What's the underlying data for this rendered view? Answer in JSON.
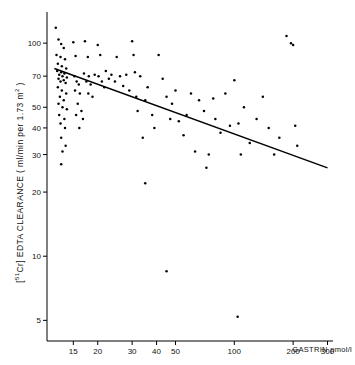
{
  "chart_data": {
    "type": "scatter",
    "title": "",
    "xlabel": "GASTRIN pmol/l",
    "ylabel": "[51Cr] EDTA CLEARANCE ( ml/min per 1.73 m2 )",
    "xscale": "log",
    "yscale": "log",
    "xlim": [
      11,
      320
    ],
    "ylim": [
      4,
      140
    ],
    "xticks": [
      15,
      20,
      30,
      40,
      50,
      100,
      200,
      300
    ],
    "xticklabels": [
      "15",
      "20",
      "30",
      "40",
      "50",
      "100",
      "200",
      "300"
    ],
    "yticks": [
      5,
      10,
      20,
      30,
      40,
      50,
      70,
      100
    ],
    "yticklabels": [
      "5",
      "10",
      "20",
      "30",
      "40",
      "50",
      "70",
      "100"
    ],
    "grid": false,
    "legend": null,
    "series": [
      {
        "name": "patients",
        "marker": "dot",
        "color": "#000000",
        "points": [
          [
            12.2,
            118
          ],
          [
            12.6,
            104
          ],
          [
            13.0,
            99
          ],
          [
            13.4,
            95
          ],
          [
            12.3,
            88
          ],
          [
            12.9,
            86
          ],
          [
            13.6,
            84
          ],
          [
            12.5,
            80
          ],
          [
            13.1,
            78
          ],
          [
            13.8,
            76
          ],
          [
            12.4,
            74
          ],
          [
            13.0,
            73
          ],
          [
            13.5,
            72
          ],
          [
            12.7,
            71
          ],
          [
            13.2,
            70
          ],
          [
            13.9,
            69
          ],
          [
            12.6,
            68
          ],
          [
            13.4,
            67
          ],
          [
            12.9,
            66
          ],
          [
            13.7,
            65
          ],
          [
            12.5,
            62
          ],
          [
            13.1,
            60
          ],
          [
            13.8,
            58
          ],
          [
            12.8,
            56
          ],
          [
            13.4,
            54
          ],
          [
            12.6,
            52
          ],
          [
            13.2,
            50
          ],
          [
            13.9,
            49
          ],
          [
            12.7,
            46
          ],
          [
            13.5,
            44
          ],
          [
            12.9,
            42
          ],
          [
            13.6,
            40
          ],
          [
            13.0,
            36
          ],
          [
            13.7,
            33
          ],
          [
            13.2,
            31
          ],
          [
            15.0,
            101
          ],
          [
            15.4,
            87
          ],
          [
            15.2,
            70
          ],
          [
            15.6,
            66
          ],
          [
            16.0,
            64
          ],
          [
            15.3,
            60
          ],
          [
            16.2,
            58
          ],
          [
            15.8,
            52
          ],
          [
            16.5,
            48
          ],
          [
            15.5,
            46
          ],
          [
            16.8,
            44
          ],
          [
            16.1,
            40
          ],
          [
            17.2,
            102
          ],
          [
            17.8,
            86
          ],
          [
            17.0,
            72
          ],
          [
            18.0,
            70
          ],
          [
            17.5,
            66
          ],
          [
            18.4,
            64
          ],
          [
            17.9,
            58
          ],
          [
            18.8,
            56
          ],
          [
            19.3,
            71
          ],
          [
            20.0,
            98
          ],
          [
            20.6,
            88
          ],
          [
            20.2,
            70
          ],
          [
            21.0,
            66
          ],
          [
            21.6,
            62
          ],
          [
            22.0,
            74
          ],
          [
            22.8,
            68
          ],
          [
            23.5,
            71
          ],
          [
            24.5,
            66
          ],
          [
            25.0,
            86
          ],
          [
            26.0,
            70
          ],
          [
            27.0,
            63
          ],
          [
            28.0,
            71
          ],
          [
            29.0,
            60
          ],
          [
            30.0,
            102
          ],
          [
            30.5,
            88
          ],
          [
            31.0,
            73
          ],
          [
            31.5,
            56
          ],
          [
            32.0,
            48
          ],
          [
            33.0,
            70
          ],
          [
            34.0,
            36
          ],
          [
            35.0,
            54
          ],
          [
            36.0,
            62
          ],
          [
            38.0,
            46
          ],
          [
            39.0,
            40
          ],
          [
            41.0,
            88
          ],
          [
            43.0,
            68
          ],
          [
            45.0,
            56
          ],
          [
            47.0,
            44
          ],
          [
            48.0,
            52
          ],
          [
            50.0,
            60
          ],
          [
            52.0,
            43
          ],
          [
            55.0,
            37
          ],
          [
            57.0,
            46
          ],
          [
            60.0,
            58
          ],
          [
            63.0,
            31
          ],
          [
            66.0,
            54
          ],
          [
            70.0,
            48
          ],
          [
            74.0,
            30
          ],
          [
            78.0,
            55
          ],
          [
            80.0,
            44
          ],
          [
            85.0,
            38
          ],
          [
            90.0,
            58
          ],
          [
            95.0,
            41
          ],
          [
            100.0,
            67
          ],
          [
            105.0,
            42
          ],
          [
            108.0,
            30
          ],
          [
            112.0,
            50
          ],
          [
            120.0,
            34
          ],
          [
            130.0,
            44
          ],
          [
            140.0,
            56
          ],
          [
            150.0,
            40
          ],
          [
            160.0,
            30
          ],
          [
            170.0,
            36
          ],
          [
            185.0,
            108
          ],
          [
            195.0,
            100
          ],
          [
            200.0,
            98
          ],
          [
            205.0,
            41
          ],
          [
            210.0,
            33
          ],
          [
            35.0,
            22
          ],
          [
            45.0,
            8.5
          ],
          [
            72.0,
            26
          ],
          [
            104.0,
            5.2
          ],
          [
            13.0,
            27
          ]
        ]
      },
      {
        "name": "regression line",
        "type": "line",
        "color": "#000000",
        "points": [
          [
            12.0,
            76
          ],
          [
            300.0,
            26
          ]
        ]
      }
    ]
  },
  "axis": {
    "x_title": "GASTRIN pmol/l",
    "y_title_prefix": "[",
    "y_title_sup": "51",
    "y_title_mid": "Cr] EDTA CLEARANCE ( ml/min per 1.73 m",
    "y_title_sup2": "2",
    "y_title_suffix": " )"
  }
}
